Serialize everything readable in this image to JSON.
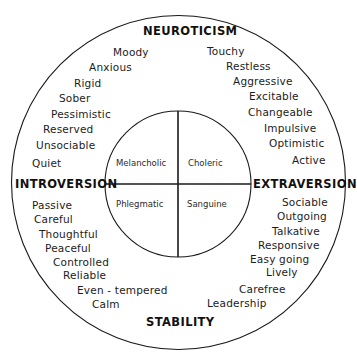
{
  "diagram": {
    "type": "personality-circumplex",
    "colors": {
      "background": "#ffffff",
      "line": "#1a1a1a",
      "text": "#1c1c1c"
    },
    "axes": {
      "top": "NEUROTICISM",
      "bottom": "STABILITY",
      "left": "INTROVERSION",
      "right": "EXTRAVERSION"
    },
    "temperaments": {
      "top_left": "Melancholic",
      "top_right": "Choleric",
      "bottom_left": "Phlegmatic",
      "bottom_right": "Sanguine"
    },
    "traits": {
      "top_left": [
        "Moody",
        "Anxious",
        "Rigid",
        "Sober",
        "Pessimistic",
        "Reserved",
        "Unsociable",
        "Quiet"
      ],
      "top_right": [
        "Touchy",
        "Restless",
        "Aggressive",
        "Excitable",
        "Changeable",
        "Impulsive",
        "Optimistic",
        "Active"
      ],
      "bottom_left": [
        "Passive",
        "Careful",
        "Thoughtful",
        "Peaceful",
        "Controlled",
        "Reliable",
        "Even - tempered",
        "Calm"
      ],
      "bottom_right": [
        "Sociable",
        "Outgoing",
        "Talkative",
        "Responsive",
        "Easy going",
        "Lively",
        "Carefree",
        "Leadership"
      ]
    }
  }
}
